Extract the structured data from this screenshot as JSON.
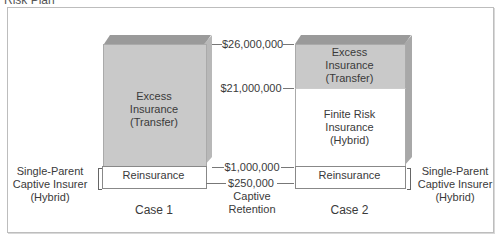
{
  "title": "Risk Plan",
  "case1": {
    "label": "Case 1",
    "excess_line1": "Excess",
    "excess_line2": "Insurance",
    "excess_line3": "(Transfer)",
    "reinsurance": "Reinsurance"
  },
  "case2": {
    "label": "Case 2",
    "excess_line1": "Excess",
    "excess_line2": "Insurance",
    "excess_line3": "(Transfer)",
    "finite_line1": "Finite Risk",
    "finite_line2": "Insurance",
    "finite_line3": "(Hybrid)",
    "reinsurance": "Reinsurance"
  },
  "levels": {
    "l26m": "$26,000,000",
    "l21m": "$21,000,000",
    "l1m": "$1,000,000",
    "l250k": "$250,000",
    "captive_line1": "Captive",
    "captive_line2": "Retention"
  },
  "left_label": {
    "line1": "Single-Parent",
    "line2": "Captive Insurer",
    "line3": "(Hybrid)"
  },
  "right_label": {
    "line1": "Single-Parent",
    "line2": "Captive Insurer",
    "line3": "(Hybrid)"
  },
  "colors": {
    "excess_fill": "#c9c9c9",
    "box_top": "#9a9a9a",
    "box_side": "#b8b8b8"
  }
}
